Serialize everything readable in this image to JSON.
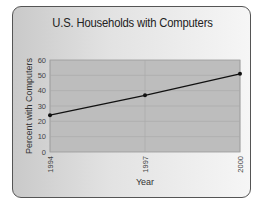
{
  "chart_data": {
    "type": "line",
    "title": "U.S. Households with Computers",
    "xlabel": "Year",
    "ylabel": "Percent with Computers",
    "categories": [
      "1994",
      "1997",
      "2000"
    ],
    "x": [
      1994,
      1997,
      2000
    ],
    "series": [
      {
        "name": "Percent with Computers",
        "values": [
          24,
          37,
          51
        ]
      }
    ],
    "yticks": [
      0,
      10,
      20,
      30,
      40,
      50,
      60
    ],
    "ylim": [
      0,
      60
    ],
    "grid": true,
    "legend": "none"
  },
  "labels": {
    "title": "U.S. Households with Computers",
    "xlabel": "Year",
    "ylabel": "Percent with Computers",
    "yticks": [
      "0",
      "10",
      "20",
      "30",
      "40",
      "50",
      "60"
    ],
    "xticks": [
      "1994",
      "1997",
      "2000"
    ]
  },
  "colors": {
    "plot_bg": "#bdbdbd",
    "line": "#111111",
    "grid": "#a8a8a8"
  }
}
